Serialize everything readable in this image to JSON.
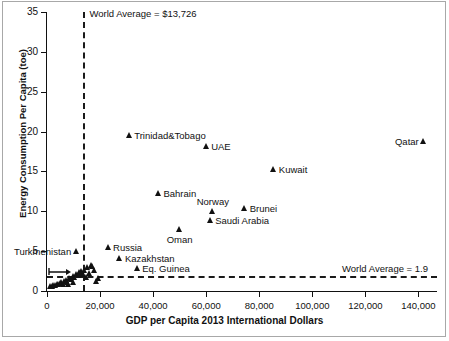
{
  "chart_data": {
    "type": "scatter",
    "title": "",
    "xlabel": "GDP per Capita 2013 International  Dollars",
    "ylabel": "Energy Consumption Per Capita (toe)",
    "xlim": [
      0,
      147000
    ],
    "ylim": [
      0,
      35
    ],
    "xticks": [
      0,
      20000,
      40000,
      60000,
      80000,
      100000,
      120000,
      140000
    ],
    "xtick_labels": [
      "0",
      "20,000",
      "40,000",
      "60,000",
      "80,000",
      "100,000",
      "120,000",
      "140,000"
    ],
    "yticks": [
      0,
      5,
      10,
      15,
      20,
      25,
      30,
      35
    ],
    "ytick_labels": [
      "0",
      "5",
      "10",
      "15",
      "20",
      "25",
      "30",
      "35"
    ],
    "grid": false,
    "legend": "none",
    "marker": "triangle",
    "marker_color": "#111111",
    "reference_lines": [
      {
        "name": "world-average-gdp",
        "orientation": "vertical",
        "value": 13726,
        "label": "World Average = $13,726",
        "style": "dashed"
      },
      {
        "name": "world-average-energy",
        "orientation": "horizontal",
        "value": 1.9,
        "label": "World Average = 1.9",
        "style": "dashed"
      }
    ],
    "labeled_points": [
      {
        "name": "Qatar",
        "x": 142000,
        "y": 18.5,
        "label_pos": "left"
      },
      {
        "name": "Trinidad&Tobago",
        "x": 31000,
        "y": 19.2,
        "label_pos": "right"
      },
      {
        "name": "UAE",
        "x": 60000,
        "y": 17.8,
        "label_pos": "right"
      },
      {
        "name": "Kuwait",
        "x": 85500,
        "y": 14.9,
        "label_pos": "right"
      },
      {
        "name": "Bahrain",
        "x": 42000,
        "y": 11.9,
        "label_pos": "right"
      },
      {
        "name": "Brunei",
        "x": 74500,
        "y": 10.0,
        "label_pos": "right"
      },
      {
        "name": "Norway",
        "x": 62500,
        "y": 9.7,
        "label_pos": "above"
      },
      {
        "name": "Saudi Arabia",
        "x": 61500,
        "y": 8.5,
        "label_pos": "right"
      },
      {
        "name": "Oman",
        "x": 50000,
        "y": 7.4,
        "label_pos": "below"
      },
      {
        "name": "Turkmenistan",
        "x": 11000,
        "y": 4.7,
        "label_pos": "left"
      },
      {
        "name": "Russia",
        "x": 23000,
        "y": 5.2,
        "label_pos": "right"
      },
      {
        "name": "Kazakhstan",
        "x": 27500,
        "y": 3.8,
        "label_pos": "right"
      },
      {
        "name": "Eq. Guinea",
        "x": 34000,
        "y": 2.5,
        "label_pos": "right"
      }
    ],
    "unlabeled_points": [
      {
        "x": 1500,
        "y": 0.25
      },
      {
        "x": 2100,
        "y": 0.3
      },
      {
        "x": 2600,
        "y": 0.35
      },
      {
        "x": 3200,
        "y": 0.4
      },
      {
        "x": 3900,
        "y": 0.5
      },
      {
        "x": 4400,
        "y": 0.45
      },
      {
        "x": 5000,
        "y": 0.6
      },
      {
        "x": 5600,
        "y": 0.7
      },
      {
        "x": 6100,
        "y": 0.55
      },
      {
        "x": 6700,
        "y": 0.9
      },
      {
        "x": 7300,
        "y": 1.0
      },
      {
        "x": 7900,
        "y": 0.8
      },
      {
        "x": 8500,
        "y": 1.2
      },
      {
        "x": 9200,
        "y": 1.1
      },
      {
        "x": 9800,
        "y": 1.5
      },
      {
        "x": 10500,
        "y": 1.35
      },
      {
        "x": 11200,
        "y": 1.8
      },
      {
        "x": 11800,
        "y": 1.6
      },
      {
        "x": 12500,
        "y": 1.9
      },
      {
        "x": 13100,
        "y": 2.1
      },
      {
        "x": 13600,
        "y": 1.7
      },
      {
        "x": 14200,
        "y": 2.3
      },
      {
        "x": 14800,
        "y": 1.4
      },
      {
        "x": 15400,
        "y": 2.6
      },
      {
        "x": 16000,
        "y": 1.9
      },
      {
        "x": 16600,
        "y": 2.9
      },
      {
        "x": 17300,
        "y": 2.8
      },
      {
        "x": 18000,
        "y": 2.2
      },
      {
        "x": 18600,
        "y": 0.9
      },
      {
        "x": 19300,
        "y": 1.3
      },
      {
        "x": 12200,
        "y": 2.0
      },
      {
        "x": 10000,
        "y": 0.7
      },
      {
        "x": 8000,
        "y": 0.5
      }
    ]
  }
}
